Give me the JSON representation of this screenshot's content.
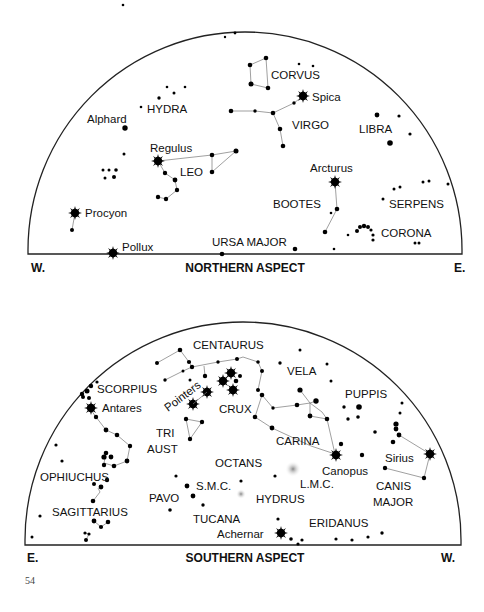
{
  "northern": {
    "title": "NORTHERN ASPECT",
    "left_dir": "W.",
    "right_dir": "E.",
    "labels": {
      "corvus": "CORVUS",
      "spica": "Spica",
      "hydra": "HYDRA",
      "alphard": "Alphard",
      "virgo": "VIRGO",
      "libra": "LIBRA",
      "regulus": "Regulus",
      "leo": "LEO",
      "arcturus": "Arcturus",
      "bootes": "BOOTES",
      "serpens": "SERPENS",
      "procyon": "Procyon",
      "corona": "CORONA",
      "pollux": "Pollux",
      "ursa_major": "URSA MAJOR"
    }
  },
  "southern": {
    "title": "SOUTHERN ASPECT",
    "left_dir": "E.",
    "right_dir": "W.",
    "labels": {
      "centaurus": "CENTAURUS",
      "scorpius": "SCORPIUS",
      "vela": "VELA",
      "pointers": "Pointers",
      "antares": "Antares",
      "crux": "CRUX",
      "puppis": "PUPPIS",
      "tri": "TRI",
      "aust": "AUST",
      "carina": "CARINA",
      "octans": "OCTANS",
      "sirius": "Sirius",
      "ophiuchus": "OPHIUCHUS",
      "canopus": "Canopus",
      "lmc": "L.M.C.",
      "smc": "S.M.C.",
      "canis": "CANIS",
      "major": "MAJOR",
      "pavo": "PAVO",
      "hydrus": "HYDRUS",
      "sagittarius": "SAGITTARIUS",
      "tucana": "TUCANA",
      "eridanus": "ERIDANUS",
      "achernar": "Achernar"
    }
  },
  "page_number": "54"
}
